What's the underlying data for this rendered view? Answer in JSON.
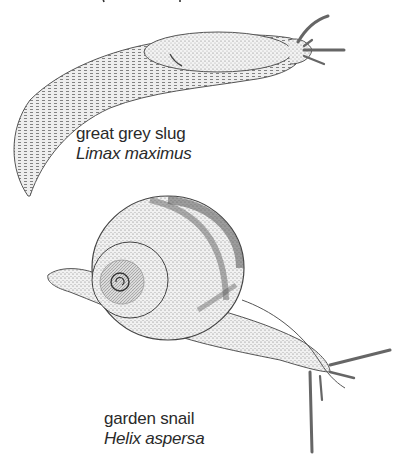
{
  "figures": [
    {
      "id": "slug",
      "common_name": "great grey slug",
      "scientific_name": "Limax maximus"
    },
    {
      "id": "snail",
      "common_name": "garden snail",
      "scientific_name": "Helix aspersa"
    }
  ]
}
